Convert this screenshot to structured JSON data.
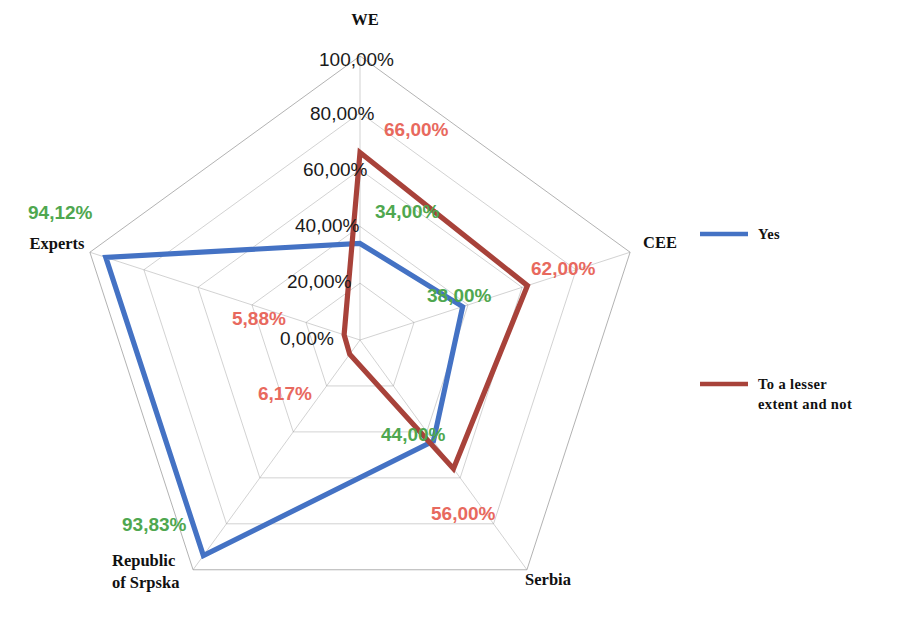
{
  "chart_data": {
    "type": "radar",
    "title": "",
    "categories": [
      "WE",
      "CEE",
      "Serbia",
      "Republic of Srpska",
      "Experts"
    ],
    "series": [
      {
        "name": "Yes",
        "color": "#4472C4",
        "values": [
          34.0,
          38.0,
          44.0,
          93.83,
          94.12
        ],
        "labels": [
          "34,00%",
          "38,00%",
          "44,00%",
          "93,83%",
          "94,12%"
        ],
        "label_color": "#4FA74F"
      },
      {
        "name": "To a lesser extent and not",
        "color": "#A8423A",
        "values": [
          66.0,
          62.0,
          56.0,
          6.17,
          5.88
        ],
        "labels": [
          "66,00%",
          "62,00%",
          "56,00%",
          "6,17%",
          "5,88%"
        ],
        "label_color": "#E8695E"
      }
    ],
    "rlim": [
      0,
      100
    ],
    "rticks": [
      0,
      20,
      40,
      60,
      80,
      100
    ],
    "rtick_labels": [
      "0,00%",
      "20,00%",
      "40,00%",
      "60,00%",
      "80,00%",
      "100,00%"
    ],
    "grid": true,
    "legend_position": "right",
    "gridline_color": "#9a9a9a",
    "background": "#ffffff"
  },
  "axis_labels": {
    "we": "WE",
    "cee": "CEE",
    "serbia": "Serbia",
    "republic_of_srpska_line1": "Republic",
    "republic_of_srpska_line2": "of Srpska",
    "experts": "Experts"
  },
  "radial_ticks": [
    {
      "value": "100,00%",
      "x": 319,
      "y": 66
    },
    {
      "value": "80,00%",
      "x": 310,
      "y": 120
    },
    {
      "value": "60,00%",
      "x": 303,
      "y": 176
    },
    {
      "value": "40,00%",
      "x": 295,
      "y": 232
    },
    {
      "value": "20,00%",
      "x": 287,
      "y": 288
    },
    {
      "value": "0,00%",
      "x": 280,
      "y": 345
    }
  ],
  "value_labels": [
    {
      "text": "66,00%",
      "color": "#E8695E",
      "x": 384,
      "y": 136,
      "anchor": "start",
      "name": "value-label-we-lesser"
    },
    {
      "text": "34,00%",
      "color": "#4FA74F",
      "x": 375,
      "y": 218,
      "anchor": "start",
      "name": "value-label-we-yes"
    },
    {
      "text": "62,00%",
      "color": "#E8695E",
      "x": 531,
      "y": 275,
      "anchor": "start",
      "name": "value-label-cee-lesser"
    },
    {
      "text": "38,00%",
      "color": "#4FA74F",
      "x": 427,
      "y": 302,
      "anchor": "start",
      "name": "value-label-cee-yes"
    },
    {
      "text": "44,00%",
      "color": "#4FA74F",
      "x": 381,
      "y": 441,
      "anchor": "start",
      "name": "value-label-serbia-yes"
    },
    {
      "text": "56,00%",
      "color": "#E8695E",
      "x": 431,
      "y": 520,
      "anchor": "start",
      "name": "value-label-serbia-lesser"
    },
    {
      "text": "93,83%",
      "color": "#4FA74F",
      "x": 122,
      "y": 531,
      "anchor": "start",
      "name": "value-label-srpska-yes"
    },
    {
      "text": "6,17%",
      "color": "#E8695E",
      "x": 258,
      "y": 400,
      "anchor": "start",
      "name": "value-label-srpska-lesser"
    },
    {
      "text": "94,12%",
      "color": "#4FA74F",
      "x": 28,
      "y": 219,
      "anchor": "start",
      "name": "value-label-experts-yes"
    },
    {
      "text": "5,88%",
      "color": "#E8695E",
      "x": 232,
      "y": 325,
      "anchor": "start",
      "name": "value-label-experts-lesser"
    }
  ],
  "category_label_positions": [
    {
      "key": "we",
      "text": "WE",
      "x": 365,
      "y": 25,
      "anchor": "middle",
      "name": "axis-label-we"
    },
    {
      "key": "cee",
      "text": "CEE",
      "x": 660,
      "y": 248,
      "anchor": "middle",
      "name": "axis-label-cee"
    },
    {
      "key": "serbia",
      "text": "Serbia",
      "x": 548,
      "y": 585,
      "anchor": "middle",
      "name": "axis-label-serbia"
    },
    {
      "key": "experts",
      "text": "Experts",
      "x": 57,
      "y": 249,
      "anchor": "middle",
      "name": "axis-label-experts"
    }
  ],
  "legend": {
    "items": [
      {
        "label": "Yes",
        "color": "#4472C4",
        "swatch_x": 700,
        "swatch_y": 234,
        "text_x": 758,
        "text_y": 239,
        "name": "legend-item-yes"
      },
      {
        "label_line1": "To a lesser",
        "label_line2": "extent and not",
        "color": "#A8423A",
        "swatch_x": 700,
        "swatch_y": 384,
        "text_x": 758,
        "text_y": 389,
        "name": "legend-item-lesser"
      }
    ]
  }
}
